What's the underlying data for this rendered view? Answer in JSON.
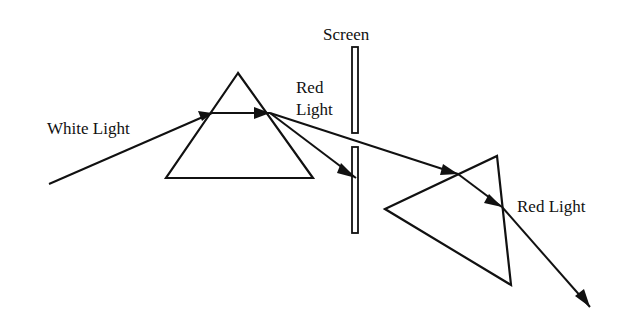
{
  "diagram": {
    "title": "",
    "colors": {
      "stroke": "#111111",
      "background": "#ffffff"
    },
    "labels": {
      "white_light": "White Light",
      "screen": "Screen",
      "red_light_top_line1": "Red",
      "red_light_top_line2": "Light",
      "red_light_right": "Red Light"
    },
    "elements": {
      "prism_1": {
        "shape": "triangle",
        "points": [
          [
            238,
            73
          ],
          [
            166,
            178
          ],
          [
            313,
            178
          ]
        ]
      },
      "prism_2": {
        "shape": "triangle",
        "points": [
          [
            385,
            209
          ],
          [
            497,
            156
          ],
          [
            511,
            285
          ]
        ]
      },
      "screen_upper": {
        "x": 352,
        "y": 47,
        "w": 6,
        "h": 86
      },
      "screen_lower": {
        "x": 352,
        "y": 147,
        "w": 6,
        "h": 86
      }
    },
    "rays": [
      {
        "name": "white-light-incident",
        "from": [
          49,
          184
        ],
        "to": [
          212,
          113
        ]
      },
      {
        "name": "ray-inside-prism-1",
        "from": [
          212,
          113
        ],
        "to": [
          270,
          113
        ]
      },
      {
        "name": "ray-to-screen",
        "from": [
          270,
          113
        ],
        "to": [
          355,
          177
        ]
      },
      {
        "name": "red-light-through-slit",
        "from": [
          270,
          113
        ],
        "to": [
          458,
          174
        ]
      },
      {
        "name": "ray-inside-prism-2",
        "from": [
          458,
          174
        ],
        "to": [
          502,
          207
        ]
      },
      {
        "name": "red-light-exit",
        "from": [
          502,
          207
        ],
        "to": [
          590,
          307
        ]
      }
    ]
  }
}
